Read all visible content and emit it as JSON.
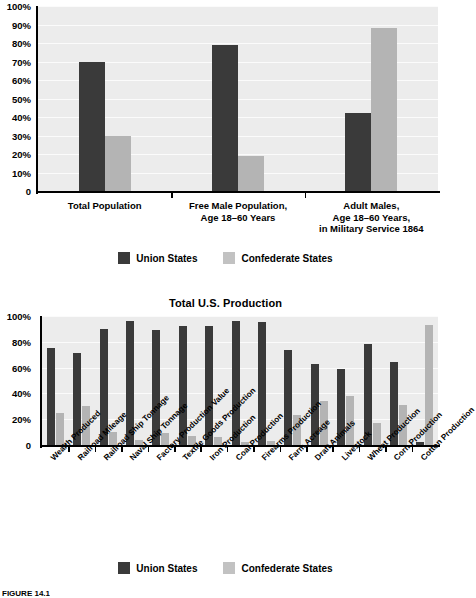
{
  "figure": {
    "caption": "FIGURE 14.1"
  },
  "legend": {
    "union_label": "Union States",
    "confederate_label": "Confederate States",
    "union_color": "#3a3a3a",
    "confederate_color": "#b4b4b4"
  },
  "chart_data": [
    {
      "type": "bar",
      "title": "",
      "xlabel": "",
      "ylabel": "",
      "ylim": [
        0,
        100
      ],
      "ytick_labels": [
        "100%",
        "90%",
        "80%",
        "70%",
        "60%",
        "50%",
        "40%",
        "30%",
        "20%",
        "10%",
        "0"
      ],
      "yticks": [
        100,
        90,
        80,
        70,
        60,
        50,
        40,
        30,
        20,
        10,
        0
      ],
      "grid": true,
      "legend_position": "bottom",
      "categories": [
        "Total Population",
        "Free Male Population,\nAge 18–60 Years",
        "Adult Males,\nAge 18–60 Years,\nin Military Service 1864"
      ],
      "category_lines": [
        [
          "Total Population"
        ],
        [
          "Free Male Population,",
          "Age 18–60 Years"
        ],
        [
          "Adult Males,",
          "Age 18–60 Years,",
          "in Military Service 1864"
        ]
      ],
      "series": [
        {
          "name": "Union States",
          "values": [
            70,
            79,
            42
          ]
        },
        {
          "name": "Confederate States",
          "values": [
            30,
            19,
            88
          ]
        }
      ]
    },
    {
      "type": "bar",
      "title": "Total U.S. Production",
      "xlabel": "",
      "ylabel": "",
      "ylim": [
        0,
        100
      ],
      "ytick_labels": [
        "100%",
        "80%",
        "60%",
        "40%",
        "20%",
        "0"
      ],
      "yticks": [
        100,
        80,
        60,
        40,
        20,
        0
      ],
      "grid": true,
      "legend_position": "bottom",
      "categories": [
        "Wealth Produced",
        "Railroad Mileage",
        "Railroad Ship Tonnage",
        "Naval Ship Tonnage",
        "Factory Production Value",
        "Textile Goods Production",
        "Iron Production",
        "Coal Production",
        "Firearms Production",
        "Farm Acreage",
        "Draft Animals",
        "Livestock",
        "Wheat Production",
        "Corn Production",
        "Cotton Production"
      ],
      "series": [
        {
          "name": "Union States",
          "values": [
            75,
            71,
            90,
            96,
            89,
            92,
            92,
            96,
            95,
            74,
            63,
            59,
            78,
            64,
            2
          ]
        },
        {
          "name": "Confederate States",
          "values": [
            25,
            30,
            10,
            4,
            9,
            7,
            6,
            2,
            3,
            23,
            34,
            38,
            17,
            31,
            93
          ]
        }
      ]
    }
  ]
}
